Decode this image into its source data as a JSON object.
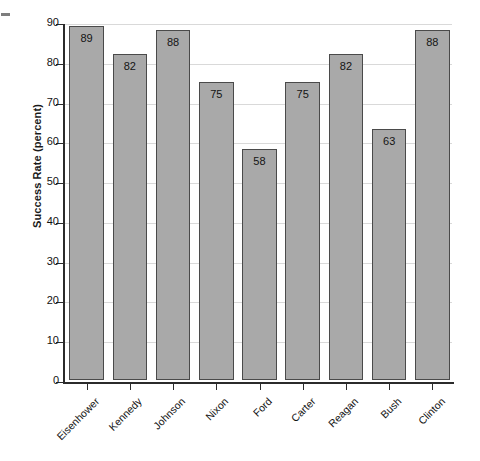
{
  "chart_data": {
    "type": "bar",
    "title": "",
    "xlabel": "",
    "ylabel": "Success Rate (percent)",
    "categories": [
      "Eisenhower",
      "Kennedy",
      "Johnson",
      "Nixon",
      "Ford",
      "Carter",
      "Reagan",
      "Bush",
      "Clinton"
    ],
    "values": [
      89,
      82,
      88,
      75,
      58,
      75,
      82,
      63,
      88
    ],
    "value_labels": [
      "89",
      "82",
      "88",
      "75",
      "58",
      "75",
      "82",
      "63",
      "88"
    ],
    "ylim": [
      0,
      90
    ],
    "ytick_labels": [
      "0",
      "10",
      "20",
      "30",
      "40",
      "50",
      "60",
      "70",
      "80",
      "90"
    ],
    "ytick_values": [
      0,
      10,
      20,
      30,
      40,
      50,
      60,
      70,
      80,
      90
    ],
    "grid": true,
    "legend": false,
    "bar_color": "#a9a9a9",
    "bar_edge_color": "#4a4a4a",
    "grid_color": "#d9d9d9",
    "axis_color": "#2b2b2b"
  }
}
